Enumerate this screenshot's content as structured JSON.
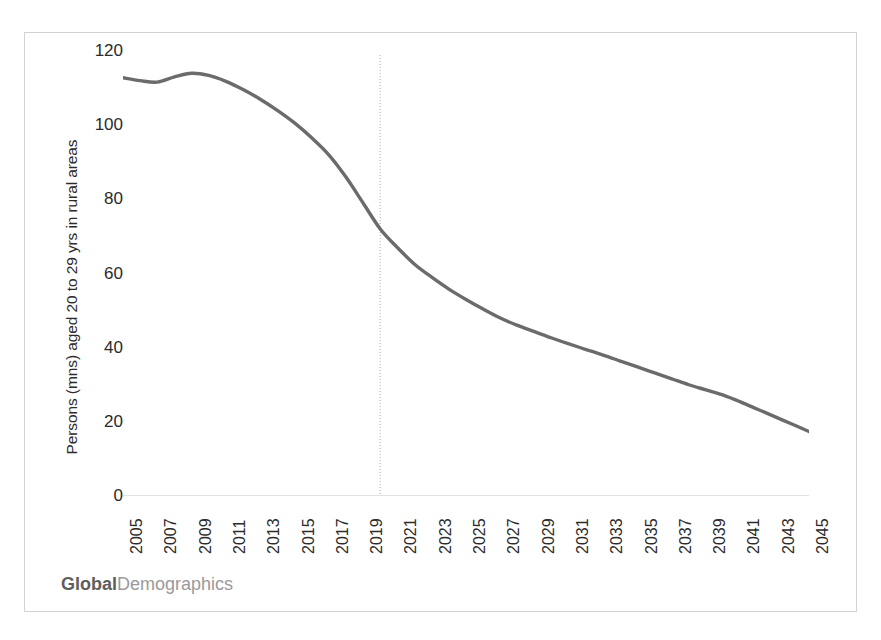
{
  "figure": {
    "brand_strong": "Global",
    "brand_light": "Demographics"
  },
  "chart_data": {
    "type": "line",
    "title": "",
    "xlabel": "",
    "ylabel": "Persons (mns) aged 20 to 29 yrs in rural areas",
    "ylim": [
      0,
      120
    ],
    "xlim": [
      2005,
      2045
    ],
    "yticks": [
      0,
      20,
      40,
      60,
      80,
      100,
      120
    ],
    "ytick_labels": [
      "0",
      "20",
      "40",
      "60",
      "80",
      "100",
      "120"
    ],
    "xtick_labels": [
      "2005",
      "2007",
      "2009",
      "2011",
      "2013",
      "2015",
      "2017",
      "2019",
      "2021",
      "2023",
      "2025",
      "2027",
      "2029",
      "2031",
      "2033",
      "2035",
      "2037",
      "2039",
      "2041",
      "2043",
      "2045"
    ],
    "grid": false,
    "legend": false,
    "line_color": "#6b6b6b",
    "axis_color": "#d9d9d9",
    "reference_line": {
      "x": 2020,
      "style": "dotted",
      "color": "#bcbcbc"
    },
    "x": [
      2005,
      2006,
      2007,
      2008,
      2009,
      2010,
      2011,
      2012,
      2013,
      2014,
      2015,
      2016,
      2017,
      2018,
      2019,
      2020,
      2021,
      2022,
      2023,
      2024,
      2025,
      2026,
      2027,
      2028,
      2029,
      2030,
      2031,
      2032,
      2033,
      2034,
      2035,
      2036,
      2037,
      2038,
      2039,
      2040,
      2041,
      2042,
      2043,
      2044,
      2045
    ],
    "series": [
      {
        "name": "Persons aged 20 to 29 yrs in rural areas",
        "values": [
          112.8,
          112.0,
          111.6,
          113.0,
          114.0,
          113.4,
          111.8,
          109.6,
          107.0,
          104.0,
          100.6,
          96.6,
          92.0,
          86.0,
          79.0,
          72.0,
          67.0,
          62.5,
          59.0,
          55.8,
          53.0,
          50.4,
          48.0,
          46.0,
          44.3,
          42.6,
          41.0,
          39.5,
          38.0,
          36.4,
          34.8,
          33.2,
          31.6,
          30.0,
          28.6,
          27.2,
          25.4,
          23.4,
          21.4,
          19.4,
          17.4
        ]
      }
    ]
  }
}
